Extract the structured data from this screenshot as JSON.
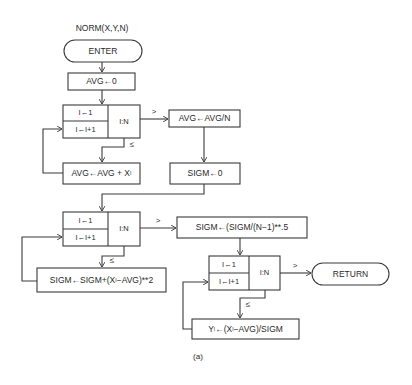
{
  "diagram": {
    "title": "NORM(X,Y,N)",
    "caption": "(a)",
    "nodes": {
      "enter": {
        "label": "ENTER",
        "shape": "terminal"
      },
      "avg_init": {
        "label": "AVG←0",
        "shape": "process"
      },
      "loop1": {
        "init": "I←1",
        "incr": "I←I+1",
        "test": "I:N",
        "shape": "loop"
      },
      "avg_accum": {
        "label_main": "AVG←AVG + X",
        "label_sub": "I",
        "shape": "process"
      },
      "avg_div": {
        "label": "AVG←AVG/N",
        "shape": "process"
      },
      "sigm_init": {
        "label": "SIGM←0",
        "shape": "process"
      },
      "loop2": {
        "init": "I←1",
        "incr": "I←I+1",
        "test": "I:N",
        "shape": "loop"
      },
      "sigm_accum": {
        "label_a": "SIGM←SIGM+(X",
        "label_sub": "I",
        "label_b": "−AVG)**2",
        "shape": "process"
      },
      "sigm_sqrt": {
        "label": "SIGM←(SIGM/(N−1)**.5",
        "shape": "process"
      },
      "loop3": {
        "init": "I←1",
        "incr": "I←I+1",
        "test": "I:N",
        "shape": "loop"
      },
      "y_calc": {
        "label_a": "Y",
        "label_sub1": "I",
        "label_b": "←(X",
        "label_sub2": "I",
        "label_c": "−AVG)/SIGM",
        "shape": "process"
      },
      "return": {
        "label": "RETURN",
        "shape": "terminal"
      }
    },
    "edge_labels": {
      "greater": ">",
      "less_equal": "≤"
    },
    "colors": {
      "line": "#3a3a3a",
      "text": "#2a2a2a",
      "background": "#ffffff"
    }
  }
}
